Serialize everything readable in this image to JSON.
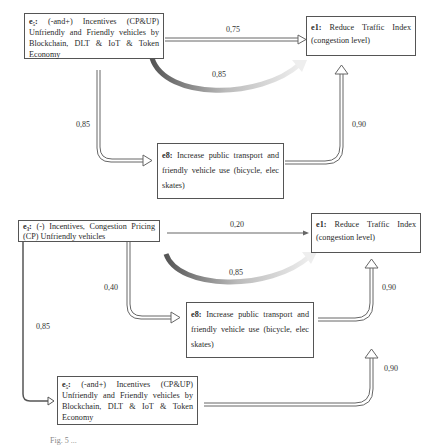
{
  "diagram_top": {
    "node_e5": {
      "id": "e5",
      "id_display": "e₅:",
      "text": "(-and+) Incentives (CP&UP) Unfriendly and Friendly vehicles by Blockchain, DLT & IoT & Token Economy"
    },
    "node_e1": {
      "id": "e1",
      "id_display": "e1:",
      "text": "Reduce Traffic Index (congestion level)"
    },
    "node_e8": {
      "id": "e8",
      "id_display": "e8:",
      "text": "Increase public transport and friendly vehicle use (bicycle, elec skates)"
    },
    "edges": [
      {
        "from": "e5",
        "to": "e1",
        "weight": "0,75",
        "style": "double-line"
      },
      {
        "from": "e5",
        "to": "e1",
        "weight": "0,85",
        "style": "curved-gradient"
      },
      {
        "from": "e5",
        "to": "e8",
        "weight": "0,85",
        "style": "double-line"
      },
      {
        "from": "e8",
        "to": "e1",
        "weight": "0,90",
        "style": "double-line"
      }
    ]
  },
  "diagram_bottom": {
    "node_e3": {
      "id": "e3",
      "id_display": "e₃:",
      "text": "(-) Incentives, Congestion Pricing (CP) Unfriendly vehicles"
    },
    "node_e1": {
      "id": "e1",
      "id_display": "e1:",
      "text": "Reduce Traffic Index (congestion level)"
    },
    "node_e8": {
      "id": "e8",
      "id_display": "e8:",
      "text": "Increase public transport and friendly vehicle use (bicycle, elec skates)"
    },
    "node_e5": {
      "id": "e5",
      "id_display": "e₅:",
      "text": "(-and+) Incentives (CP&UP) Unfriendly and Friendly vehicles by Blockchain, DLT & IoT & Token Economy"
    },
    "edges": [
      {
        "from": "e3",
        "to": "e1",
        "weight": "0,20",
        "style": "single-line"
      },
      {
        "from": "e3",
        "to": "e1",
        "weight": "0,85",
        "style": "curved-gradient"
      },
      {
        "from": "e3",
        "to": "e8",
        "weight": "0,40",
        "style": "double-line"
      },
      {
        "from": "e8",
        "to": "e1",
        "weight": "0,90",
        "style": "double-line"
      },
      {
        "from": "e3",
        "to": "e5",
        "weight": "0,85",
        "style": "single-line"
      },
      {
        "from": "e5",
        "to": "e1",
        "weight": "0,90",
        "style": "double-line"
      }
    ]
  },
  "caption": "Fig. 5 ..."
}
